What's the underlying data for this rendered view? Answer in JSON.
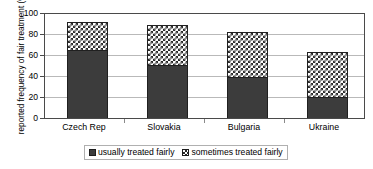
{
  "chart_data": {
    "type": "bar",
    "subtype": "stacked-vertical",
    "title": "",
    "xlabel": "",
    "ylabel": "reported frequency of fair treatment (%)",
    "ylim": [
      0,
      100
    ],
    "yticks": [
      0,
      20,
      40,
      60,
      80,
      100
    ],
    "ytick_labels": [
      "0",
      "20",
      "40",
      "60",
      "80",
      "100"
    ],
    "grid": true,
    "grid_axis": "y",
    "legend_position": "bottom",
    "categories": [
      "Czech Rep",
      "Slovakia",
      "Bulgaria",
      "Ukraine"
    ],
    "series": [
      {
        "name": "usually treated fairly",
        "color": "#3c3c3c",
        "pattern": "solid",
        "values": [
          65,
          51,
          39,
          20
        ]
      },
      {
        "name": "sometimes treated fairly",
        "color": "#2b2b2b",
        "pattern": "checkerboard",
        "values": [
          27,
          38,
          44,
          43
        ]
      }
    ],
    "totals": [
      92,
      89,
      83,
      63
    ]
  },
  "axis": {
    "y_title": "reported frequency of fair treatment (%)",
    "y_tick_labels": [
      "100",
      "80",
      "60",
      "40",
      "20",
      "0"
    ],
    "x_tick_labels": [
      "Czech Rep",
      "Slovakia",
      "Bulgaria",
      "Ukraine"
    ]
  },
  "legend": {
    "items": [
      {
        "label": "usually treated fairly",
        "swatch": "solid-dark-swatch"
      },
      {
        "label": "sometimes treated fairly",
        "swatch": "checkered-swatch"
      }
    ]
  },
  "colors": {
    "usually": "#3c3c3c",
    "sometimes_pattern": "#2b2b2b",
    "gridline": "#b9b9b9",
    "frame": "#4a4a4a",
    "background": "#ffffff"
  }
}
